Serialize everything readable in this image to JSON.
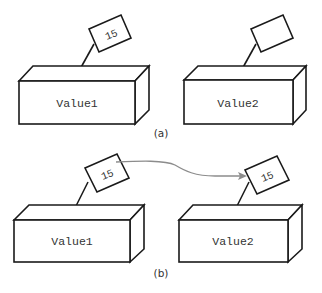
{
  "diagram": {
    "panels": [
      {
        "caption": "(a)",
        "boxes": [
          {
            "label": "Value1",
            "tag": "15"
          },
          {
            "label": "Value2",
            "tag": ""
          }
        ]
      },
      {
        "caption": "(b)",
        "boxes": [
          {
            "label": "Value1",
            "tag": "15"
          },
          {
            "label": "Value2",
            "tag": "15"
          }
        ],
        "arrow": {
          "from": "Value1 tag",
          "to": "Value2 tag",
          "meaning": "copy of value 15"
        }
      }
    ],
    "colors": {
      "stroke": "#1a1a1a",
      "arrow": "#8c8c8c",
      "text": "#333333",
      "background": "#ffffff"
    }
  }
}
